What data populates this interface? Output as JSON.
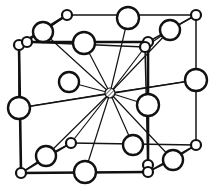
{
  "figure": {
    "canvas": {
      "width": 217,
      "height": 191
    },
    "colors": {
      "background": "#ffffff",
      "stroke": "#111111",
      "atom_fill": "#ffffff",
      "center_hatch": "#555555"
    },
    "geometry": {
      "radius_large": 10.5,
      "radius_small": 5.0,
      "radius_center": 5.0
    },
    "center_atom": {
      "name": "center-atom",
      "x": 110,
      "y": 93,
      "r": 5.0,
      "style": "hatched"
    },
    "large_atoms": [
      {
        "name": "atom-top-back-mid",
        "x": 128,
        "y": 18,
        "r": 11
      },
      {
        "name": "atom-top-left-back",
        "x": 43,
        "y": 32,
        "r": 10
      },
      {
        "name": "atom-top-front-mid",
        "x": 84,
        "y": 43,
        "r": 11
      },
      {
        "name": "atom-top-right-back",
        "x": 170,
        "y": 30,
        "r": 10
      },
      {
        "name": "atom-left-mid-front",
        "x": 19,
        "y": 108,
        "r": 11
      },
      {
        "name": "atom-interior-upleft",
        "x": 69,
        "y": 82,
        "r": 10
      },
      {
        "name": "atom-right-mid-back",
        "x": 196,
        "y": 80,
        "r": 11
      },
      {
        "name": "atom-right-mid-front",
        "x": 148,
        "y": 105,
        "r": 11
      },
      {
        "name": "atom-interior-lowleft",
        "x": 46,
        "y": 156,
        "r": 10
      },
      {
        "name": "atom-bottom-front-mid",
        "x": 85,
        "y": 172,
        "r": 11
      },
      {
        "name": "atom-interior-lowmid",
        "x": 133,
        "y": 145,
        "r": 10
      },
      {
        "name": "atom-bottom-right-back",
        "x": 173,
        "y": 160,
        "r": 10
      }
    ],
    "small_atoms": [
      {
        "name": "corner-back-top-left",
        "x": 19,
        "y": 45
      },
      {
        "name": "corner-back-top-right",
        "x": 196,
        "y": 15
      },
      {
        "name": "corner-back-bottom-left",
        "x": 21,
        "y": 173
      },
      {
        "name": "corner-back-bottom-right",
        "x": 196,
        "y": 145
      },
      {
        "name": "corner-front-top-left",
        "x": 27,
        "y": 42
      },
      {
        "name": "corner-front-top-right",
        "x": 148,
        "y": 42
      },
      {
        "name": "corner-front-bottom-right",
        "x": 148,
        "y": 165
      },
      {
        "name": "site-top-back-left",
        "x": 67,
        "y": 15
      },
      {
        "name": "site-upper-right-inner",
        "x": 145,
        "y": 47
      },
      {
        "name": "site-lower-left-inner",
        "x": 71,
        "y": 143
      },
      {
        "name": "site-lower-mid-front",
        "x": 148,
        "y": 172
      }
    ],
    "cube_edges_thick": [
      {
        "name": "edge-front-top",
        "x1": 27,
        "y1": 42,
        "x2": 148,
        "y2": 42
      },
      {
        "name": "edge-front-left",
        "x1": 19,
        "y1": 45,
        "x2": 21,
        "y2": 173
      },
      {
        "name": "edge-front-right",
        "x1": 148,
        "y1": 42,
        "x2": 148,
        "y2": 172
      },
      {
        "name": "edge-front-bottom",
        "x1": 21,
        "y1": 173,
        "x2": 148,
        "y2": 172
      },
      {
        "name": "edge-top-left-diag",
        "x1": 19,
        "y1": 45,
        "x2": 67,
        "y2": 15
      }
    ],
    "cube_edges_thin": [
      {
        "name": "edge-back-top",
        "x1": 67,
        "y1": 15,
        "x2": 196,
        "y2": 15
      },
      {
        "name": "edge-back-right",
        "x1": 196,
        "y1": 15,
        "x2": 196,
        "y2": 145
      },
      {
        "name": "edge-back-bottom",
        "x1": 71,
        "y1": 143,
        "x2": 196,
        "y2": 145
      },
      {
        "name": "edge-back-left",
        "x1": 19,
        "y1": 45,
        "x2": 19,
        "y2": 108
      },
      {
        "name": "edge-diag-bottom-left",
        "x1": 21,
        "y1": 173,
        "x2": 71,
        "y2": 143
      },
      {
        "name": "edge-diag-top-right",
        "x1": 148,
        "y1": 42,
        "x2": 196,
        "y2": 15
      },
      {
        "name": "edge-diag-bot-right",
        "x1": 148,
        "y1": 172,
        "x2": 196,
        "y2": 145
      },
      {
        "name": "edge-depth-left-mid",
        "x1": 19,
        "y1": 108,
        "x2": 196,
        "y2": 80
      },
      {
        "name": "edge-depth-top-mid",
        "x1": 27,
        "y1": 42,
        "x2": 145,
        "y2": 47
      },
      {
        "name": "edge-vert-back-inner",
        "x1": 145,
        "y1": 47,
        "x2": 148,
        "y2": 165
      }
    ],
    "bonds_from_center": [
      {
        "name": "bond-to-top-back-mid",
        "x": 128,
        "y": 18
      },
      {
        "name": "bond-to-top-left-back",
        "x": 43,
        "y": 32
      },
      {
        "name": "bond-to-top-front-mid",
        "x": 84,
        "y": 43
      },
      {
        "name": "bond-to-top-right-back",
        "x": 170,
        "y": 30
      },
      {
        "name": "bond-to-left-mid-front",
        "x": 19,
        "y": 108
      },
      {
        "name": "bond-to-interior-upleft",
        "x": 69,
        "y": 82
      },
      {
        "name": "bond-to-right-mid-back",
        "x": 196,
        "y": 80
      },
      {
        "name": "bond-to-right-mid-front",
        "x": 148,
        "y": 105
      },
      {
        "name": "bond-to-interior-lowleft",
        "x": 46,
        "y": 156
      },
      {
        "name": "bond-to-bottom-front-mid",
        "x": 85,
        "y": 172
      },
      {
        "name": "bond-to-interior-lowmid",
        "x": 133,
        "y": 145
      },
      {
        "name": "bond-to-bottom-right-back",
        "x": 173,
        "y": 160
      },
      {
        "name": "bond-to-site-lower-left",
        "x": 71,
        "y": 143
      },
      {
        "name": "bond-to-site-upper-right",
        "x": 145,
        "y": 47
      }
    ],
    "local_bonds": [
      {
        "name": "bond-topleft-pair-a",
        "x1": 43,
        "y1": 32,
        "x2": 67,
        "y2": 15
      },
      {
        "name": "bond-topleft-pair-b",
        "x1": 43,
        "y1": 32,
        "x2": 19,
        "y2": 45
      },
      {
        "name": "bond-topright-pair-a",
        "x1": 170,
        "y1": 30,
        "x2": 196,
        "y2": 15
      },
      {
        "name": "bond-topright-pair-b",
        "x1": 170,
        "y1": 30,
        "x2": 145,
        "y2": 47
      },
      {
        "name": "bond-lowleft-pair-a",
        "x1": 46,
        "y1": 156,
        "x2": 71,
        "y2": 143
      },
      {
        "name": "bond-lowleft-pair-b",
        "x1": 46,
        "y1": 156,
        "x2": 21,
        "y2": 173
      },
      {
        "name": "bond-lowright-pair-a",
        "x1": 173,
        "y1": 160,
        "x2": 196,
        "y2": 145
      },
      {
        "name": "bond-lowright-pair-b",
        "x1": 173,
        "y1": 160,
        "x2": 148,
        "y2": 172
      }
    ]
  }
}
